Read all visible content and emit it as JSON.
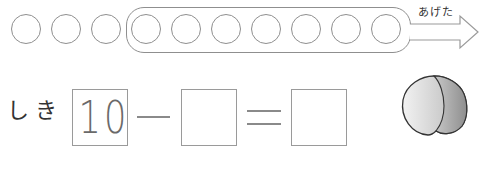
{
  "counter": {
    "total_circles": 10,
    "grouped_circles": 7,
    "arrow_label": "あげた"
  },
  "equation": {
    "label": "しき",
    "first_value": "10",
    "operator": "−",
    "second_value": "",
    "equals": "=",
    "result_value": ""
  },
  "illustration": {
    "name": "peach"
  },
  "colors": {
    "line": "#8f8f8f",
    "text": "#333333"
  }
}
